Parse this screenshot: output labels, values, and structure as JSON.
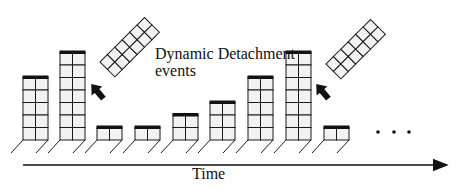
{
  "diagram": {
    "annotation_line1": "Dynamic Detachment",
    "annotation_line2": "events",
    "axis_label": "Time",
    "ellipsis": "...",
    "colors": {
      "stroke": "#1a1a1a",
      "cell_fill": "#f2f2f2",
      "cap": "#111111",
      "background": "#ffffff"
    },
    "bars": [
      {
        "x": 23,
        "rows": 5
      },
      {
        "x": 60,
        "rows": 7
      },
      {
        "x": 97,
        "rows": 1
      },
      {
        "x": 135,
        "rows": 1
      },
      {
        "x": 173,
        "rows": 2
      },
      {
        "x": 210,
        "rows": 3
      },
      {
        "x": 248,
        "rows": 5
      },
      {
        "x": 286,
        "rows": 7
      },
      {
        "x": 324,
        "rows": 1
      }
    ],
    "detached_segments": [
      {
        "after_bar": 2,
        "rows": 6
      },
      {
        "after_bar": 8,
        "rows": 6
      }
    ]
  }
}
